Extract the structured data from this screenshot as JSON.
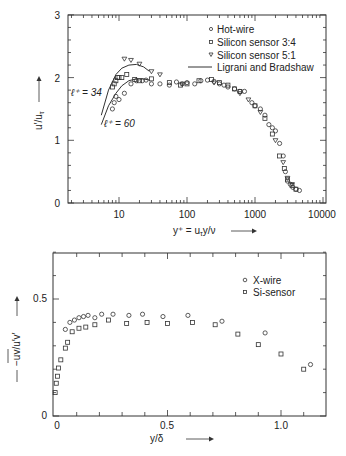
{
  "chart_data": [
    {
      "type": "scatter",
      "title": "",
      "xlabel": "y⁺ = u_τ y/ν",
      "ylabel": "u′/u_τ",
      "xscale": "log",
      "xlim": [
        1.8,
        10000
      ],
      "ylim": [
        0,
        3
      ],
      "x_ticks": [
        "10",
        "100",
        "1000",
        "10000"
      ],
      "y_ticks": [
        "0",
        "1",
        "2",
        "3"
      ],
      "legend_position": "upper right",
      "grid": false,
      "annotations": [
        "ℓ⁺ = 34",
        "ℓ⁺ = 60"
      ],
      "series": [
        {
          "name": "Hot-wire",
          "marker": "circle",
          "x": [
            8,
            8.5,
            9,
            10,
            12,
            15,
            18,
            22,
            25,
            30,
            40,
            55,
            70,
            85,
            100,
            130,
            160,
            200,
            250,
            300,
            350,
            400,
            500,
            600,
            700,
            900,
            1000,
            1200,
            1400,
            1600,
            1800,
            2000,
            2300,
            2600,
            2800,
            3000,
            3300,
            3600,
            4000,
            4500
          ],
          "y": [
            1.5,
            1.6,
            1.7,
            1.65,
            1.75,
            1.9,
            1.95,
            1.95,
            1.96,
            1.9,
            1.9,
            1.88,
            1.93,
            1.9,
            1.92,
            1.9,
            1.95,
            1.96,
            1.94,
            1.9,
            1.88,
            1.85,
            1.82,
            1.78,
            1.78,
            1.6,
            1.55,
            1.5,
            1.4,
            1.25,
            1.2,
            1.15,
            0.95,
            0.75,
            0.5,
            0.35,
            0.3,
            0.25,
            0.22,
            0.2
          ]
        },
        {
          "name": "Silicon sensor 3:4",
          "marker": "square",
          "x": [
            8,
            8.5,
            9,
            9.5,
            10,
            11,
            13,
            17,
            20,
            30,
            55,
            80,
            100,
            150,
            230,
            300,
            400,
            500,
            600,
            1000,
            1400,
            1800,
            2300,
            2700,
            3000,
            3500,
            4000
          ],
          "y": [
            1.85,
            1.9,
            1.95,
            2.0,
            2.0,
            2.0,
            2.05,
            1.97,
            1.95,
            1.98,
            1.92,
            1.88,
            1.9,
            1.95,
            1.97,
            1.92,
            1.88,
            1.82,
            1.78,
            1.55,
            1.35,
            1.1,
            0.75,
            0.55,
            0.38,
            0.28,
            0.22
          ]
        },
        {
          "name": "Silicon sensor 5:1",
          "marker": "triangle-down",
          "x": [
            12,
            15,
            20,
            30,
            40,
            85,
            250,
            600,
            800,
            1200,
            2000,
            2600,
            3000,
            3500
          ],
          "y": [
            2.3,
            2.28,
            2.22,
            2.1,
            2.05,
            1.9,
            1.92,
            1.75,
            1.65,
            1.45,
            1.0,
            0.65,
            0.4,
            0.3
          ]
        },
        {
          "name": "Ligrani and Bradshaw",
          "marker": "line",
          "curves": [
            {
              "label": "ℓ⁺ = 34",
              "x": [
                5.5,
                7,
                9,
                11,
                14,
                18,
                23,
                28
              ],
              "y": [
                1.4,
                1.8,
                2.05,
                2.15,
                2.2,
                2.21,
                2.17,
                2.1
              ]
            },
            {
              "label": "ℓ⁺ = 60",
              "x": [
                5.5,
                7,
                9,
                11,
                14,
                18,
                23,
                28
              ],
              "y": [
                1.25,
                1.55,
                1.75,
                1.87,
                1.95,
                1.98,
                1.98,
                1.96
              ]
            }
          ]
        }
      ]
    },
    {
      "type": "scatter",
      "title": "",
      "xlabel": "y/δ",
      "ylabel": "−uv/u′v′",
      "xlim": [
        0,
        1.2
      ],
      "ylim": [
        0,
        0.7
      ],
      "x_ticks": [
        "0",
        "0.5",
        "1.0"
      ],
      "y_ticks": [
        "0",
        "0.5"
      ],
      "legend_position": "upper right",
      "grid": false,
      "series": [
        {
          "name": "X-wire",
          "marker": "circle",
          "x": [
            0.05,
            0.07,
            0.09,
            0.11,
            0.13,
            0.15,
            0.18,
            0.21,
            0.26,
            0.33,
            0.39,
            0.48,
            0.59,
            0.74,
            0.93,
            1.13
          ],
          "y": [
            0.37,
            0.4,
            0.41,
            0.42,
            0.425,
            0.43,
            0.42,
            0.435,
            0.435,
            0.43,
            0.435,
            0.425,
            0.43,
            0.405,
            0.355,
            0.22
          ]
        },
        {
          "name": "Si-sensor",
          "marker": "square",
          "x": [
            0.005,
            0.01,
            0.015,
            0.02,
            0.03,
            0.05,
            0.06,
            0.08,
            0.11,
            0.14,
            0.18,
            0.24,
            0.32,
            0.41,
            0.5,
            0.61,
            0.71,
            0.81,
            0.9,
            1.0,
            1.1
          ],
          "y": [
            0.1,
            0.14,
            0.17,
            0.205,
            0.24,
            0.29,
            0.315,
            0.36,
            0.375,
            0.38,
            0.39,
            0.41,
            0.395,
            0.4,
            0.395,
            0.4,
            0.39,
            0.35,
            0.305,
            0.265,
            0.2
          ]
        }
      ]
    }
  ],
  "top": {
    "ylabel": "u′/u",
    "ylabel_sub": "τ",
    "xlabel": "y⁺ = u",
    "xlabel_sub": "τ",
    "xlabel_rest": "y/ν",
    "y_ticks": [
      "0",
      "1",
      "2",
      "3"
    ],
    "x_ticks": [
      "10",
      "100",
      "1000",
      "10000"
    ],
    "ann1": "ℓ⁺ = 34",
    "ann2": "ℓ⁺ = 60",
    "legend": [
      "Hot-wire",
      "Silicon sensor 3:4",
      "Silicon sensor 5:1",
      "Ligrani and Bradshaw"
    ]
  },
  "bottom": {
    "ylabel": "−uv/u′v′",
    "xlabel": "y/δ",
    "y_ticks": [
      "0",
      "0.5"
    ],
    "x_ticks": [
      "0",
      "0.5",
      "1.0"
    ],
    "legend": [
      "X-wire",
      "Si-sensor"
    ]
  }
}
